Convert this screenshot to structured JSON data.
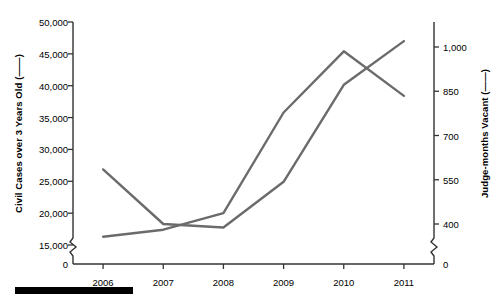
{
  "chart_data": {
    "type": "line",
    "title": "",
    "xlabel": "",
    "categories": [
      "2006",
      "2007",
      "2008",
      "2009",
      "2010",
      "2011"
    ],
    "grid": false,
    "legend_position": "axis-titles",
    "axes": {
      "left": {
        "label": "Civil Cases over 3 Years Old  (——)",
        "ticks": [
          "15,000",
          "20,000",
          "25,000",
          "30,000",
          "35,000",
          "40,000",
          "45,000",
          "50,000"
        ],
        "tick_values": [
          15000,
          20000,
          25000,
          30000,
          35000,
          40000,
          45000,
          50000
        ],
        "zero_label": "0",
        "ylim": [
          15000,
          50000
        ],
        "axis_break": true
      },
      "right": {
        "label": "Judge-months Vacant  (——)",
        "ticks": [
          "400",
          "550",
          "700",
          "850",
          "1,000"
        ],
        "tick_values": [
          400,
          550,
          700,
          850,
          1000
        ],
        "zero_label": "0",
        "ylim": [
          400,
          1000
        ],
        "axis_break": true
      }
    },
    "series": [
      {
        "name": "Civil Cases over 3 Years Old",
        "axis": "left",
        "color": "#6b6b6b",
        "values": [
          16300,
          17400,
          20000,
          35800,
          45400,
          38400
        ]
      },
      {
        "name": "Judge-months Vacant",
        "axis": "right",
        "color": "#6b6b6b",
        "values": [
          585,
          400,
          388,
          543,
          872,
          1020
        ]
      }
    ]
  },
  "decoration": {
    "bottom_bar_color": "#000000"
  }
}
